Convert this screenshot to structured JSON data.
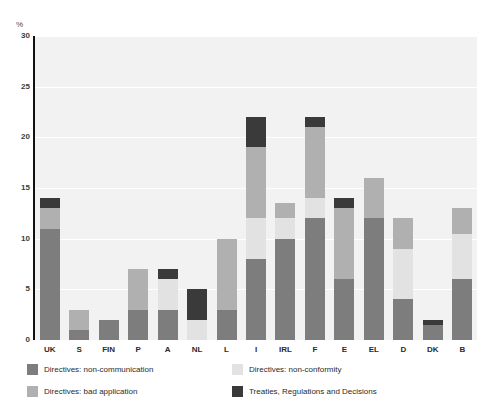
{
  "chart_data": {
    "type": "bar",
    "stacked": true,
    "title": "",
    "subtitle": "",
    "xlabel": "",
    "ylabel": "%",
    "ylim": [
      0,
      30
    ],
    "yticks": [
      0,
      5,
      10,
      15,
      20,
      25,
      30
    ],
    "ytick_labels": [
      "0",
      "5",
      "10",
      "15",
      "20",
      "25",
      "30"
    ],
    "grid": "horizontal",
    "legend_position": "bottom",
    "categories": [
      "UK",
      "S",
      "FIN",
      "P",
      "A",
      "NL",
      "L",
      "I",
      "IRL",
      "F",
      "E",
      "EL",
      "D",
      "DK",
      "B"
    ],
    "series": [
      {
        "name": "Directives: non-communication",
        "color": "#7d7d7d",
        "values": [
          11,
          1,
          2,
          3,
          3,
          0,
          3,
          8,
          10,
          12,
          6,
          12,
          4,
          1.5,
          6
        ]
      },
      {
        "name": "Directives: non-conformity",
        "color": "#e2e2e2",
        "values": [
          0,
          0,
          0,
          0,
          3,
          2,
          0,
          4,
          2,
          2,
          0,
          0,
          5,
          0,
          4.5
        ]
      },
      {
        "name": "Directives: bad application",
        "color": "#b0b0b0",
        "values": [
          2,
          2,
          0,
          4,
          0,
          0,
          7,
          7,
          1.5,
          7,
          7,
          4,
          3,
          0,
          2.5
        ]
      },
      {
        "name": "Treaties, Regulations and Decisions",
        "color": "#3a3a3a",
        "values": [
          1,
          0,
          0,
          0,
          1,
          3,
          0,
          3,
          0,
          1,
          1,
          0,
          0,
          0.5,
          0
        ]
      }
    ],
    "totals": [
      14,
      3,
      2,
      7,
      7,
      5,
      10,
      22,
      13.5,
      22,
      14,
      16,
      12,
      2,
      13
    ]
  },
  "axis": {
    "y_unit_label": "%"
  },
  "legend": {
    "items": [
      {
        "label": "Directives: non-communication",
        "color": "#7d7d7d"
      },
      {
        "label": "Directives: non-conformity",
        "color": "#e2e2e2"
      },
      {
        "label": "Directives: bad application",
        "color": "#b0b0b0"
      },
      {
        "label": "Treaties, Regulations and Decisions",
        "color": "#3a3a3a"
      }
    ]
  }
}
